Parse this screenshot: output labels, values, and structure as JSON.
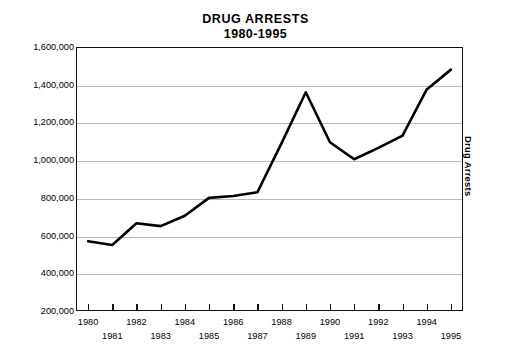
{
  "scan_artifact": {
    "top_edge_text": "",
    "note": ""
  },
  "chart_data": {
    "type": "line",
    "title": "DRUG ARRESTS",
    "subtitle": "1980-1995",
    "xlabel": "",
    "ylabel": "",
    "right_axis_label": "Drug Arrests",
    "grid": true,
    "legend": "none",
    "xlim": [
      1980,
      1995
    ],
    "ylim": [
      200000,
      1600000
    ],
    "ytick_labels": [
      "1,600,000",
      "1,400,000",
      "1,200,000",
      "1,000,000",
      "800,000",
      "600,000",
      "400,000",
      "200,000"
    ],
    "ytick_values": [
      1600000,
      1400000,
      1200000,
      1000000,
      800000,
      600000,
      400000,
      200000
    ],
    "categories": [
      "1980",
      "1981",
      "1982",
      "1983",
      "1984",
      "1985",
      "1986",
      "1987",
      "1988",
      "1989",
      "1990",
      "1991",
      "1992",
      "1993",
      "1994",
      "1995"
    ],
    "x": [
      1980,
      1981,
      1982,
      1983,
      1984,
      1985,
      1986,
      1987,
      1988,
      1989,
      1990,
      1991,
      1992,
      1993,
      1994,
      1995
    ],
    "values": [
      570000,
      550000,
      665000,
      650000,
      705000,
      800000,
      810000,
      830000,
      1090000,
      1360000,
      1095000,
      1005000,
      1065000,
      1130000,
      1375000,
      1480000
    ],
    "series": [
      {
        "name": "Drug Arrests",
        "color": "#000000",
        "values": [
          570000,
          550000,
          665000,
          650000,
          705000,
          800000,
          810000,
          830000,
          1090000,
          1360000,
          1095000,
          1005000,
          1065000,
          1130000,
          1375000,
          1480000
        ]
      }
    ]
  }
}
